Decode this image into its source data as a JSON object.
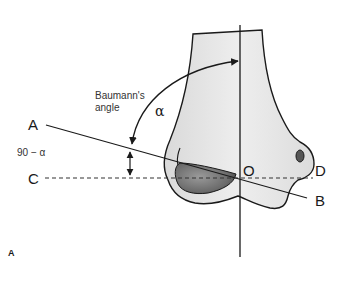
{
  "figure": {
    "panel_label": "A",
    "title_annotation": {
      "line1": "Baumann's",
      "line2": "angle"
    },
    "angle_label": "α",
    "complement_label": "90 − α",
    "points": {
      "A": "A",
      "B": "B",
      "C": "C",
      "D": "D",
      "O": "O"
    },
    "lines": [
      {
        "name": "AB",
        "style": "solid",
        "description": "line through lateral condyle physis"
      },
      {
        "name": "CD",
        "style": "dashed",
        "description": "horizontal reference line"
      },
      {
        "name": "humeral-axis",
        "style": "solid",
        "description": "vertical long axis of humerus through O"
      }
    ],
    "colors": {
      "stroke": "#1a1a1a",
      "bone_fill": "#e6e6e6",
      "capitellum_fill": "#6e6e6e",
      "background": "#ffffff"
    }
  }
}
